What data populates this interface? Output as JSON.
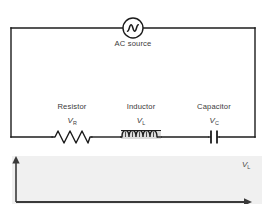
{
  "figure": {
    "type": "rlc-series-circuit-with-waveforms",
    "background_color": "#ffffff",
    "wire_color": "#1c1c1c",
    "text_color": "#3a3a3a"
  },
  "circuit": {
    "source": {
      "name": "ac-source",
      "caption": "AC source",
      "symbol": "sine-in-circle",
      "cx": 133,
      "cy": 28,
      "r": 10
    },
    "components": [
      {
        "name": "resistor",
        "label": "Resistor",
        "symbol_text": "V",
        "symbol_sub": "R",
        "glyph": "zigzag",
        "label_x": 72,
        "label_y": 106,
        "symbol_x": 72,
        "symbol_y": 120,
        "cx": 72,
        "cy": 137
      },
      {
        "name": "inductor",
        "label": "Inductor",
        "symbol_text": "V",
        "symbol_sub": "L",
        "glyph": "coil",
        "label_x": 141,
        "label_y": 106,
        "symbol_x": 141,
        "symbol_y": 120,
        "cx": 141,
        "cy": 137
      },
      {
        "name": "capacitor",
        "label": "Capacitor",
        "symbol_text": "V",
        "symbol_sub": "C",
        "glyph": "parallel-plates",
        "label_x": 214,
        "label_y": 106,
        "symbol_x": 214,
        "symbol_y": 120,
        "cx": 214,
        "cy": 137
      }
    ],
    "loop": {
      "left": 11,
      "right": 255,
      "top": 28,
      "bottom": 137
    }
  },
  "chart_data": {
    "type": "line",
    "title": "",
    "xlabel": "",
    "ylabel": "",
    "grid": false,
    "legend_position": "right-inline",
    "background_color": "#f0f0f0",
    "axis_color": "#3a3a3a",
    "plot_box": {
      "x": 12,
      "y": 156,
      "width": 250,
      "height": 48
    },
    "annotations": [
      {
        "text": "V",
        "sub": "L",
        "x": 243,
        "y": 165
      }
    ],
    "x": [
      0,
      0.25,
      0.5,
      0.75,
      1
    ],
    "xlim": [
      0,
      3.4
    ],
    "ylim": [
      0,
      1
    ],
    "series": [
      {
        "name": "V_R",
        "color": "#9a9a9a",
        "amplitude": 1.0,
        "phase_deg": 0,
        "cycles": 3.4,
        "rectified": true
      },
      {
        "name": "V_L",
        "color": "#6e6e6e",
        "amplitude": 0.88,
        "phase_deg": 90,
        "cycles": 3.4,
        "rectified": true
      },
      {
        "name": "V_C",
        "color": "#2a2a2a",
        "amplitude": 0.78,
        "phase_deg": 180,
        "cycles": 3.4,
        "rectified": true
      }
    ]
  }
}
